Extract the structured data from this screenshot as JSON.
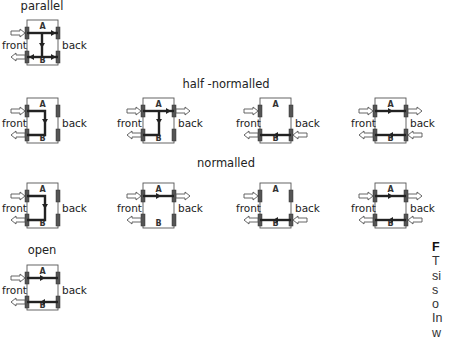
{
  "headings": {
    "parallel": "parallel",
    "half_normalled": "half -normalled",
    "normalled": "normalled",
    "open": "open"
  },
  "labels": {
    "front": "front",
    "back": "back",
    "jack_a": "A",
    "jack_b": "B"
  },
  "diagrams": [
    {
      "id": "parallel",
      "row": "parallel",
      "front_in": true,
      "front_out": true,
      "back_in": false,
      "back_out": false,
      "path": "A->B split, A->back, B->back"
    },
    {
      "id": "half-normalled-1",
      "row": "half-normalled",
      "front_in": true,
      "front_out": true,
      "back_in": false,
      "back_out": false,
      "path": "A front to B front (loop)"
    },
    {
      "id": "half-normalled-2",
      "row": "half-normalled",
      "front_in": true,
      "front_out": true,
      "back_in": false,
      "back_out": true,
      "path": "A front to back and down to B"
    },
    {
      "id": "half-normalled-3",
      "row": "half-normalled",
      "front_in": true,
      "front_out": true,
      "back_in": true,
      "back_out": false,
      "path": "B back to B front"
    },
    {
      "id": "half-normalled-4",
      "row": "half-normalled",
      "front_in": true,
      "front_out": true,
      "back_in": true,
      "back_out": true,
      "path": "A through, B through"
    },
    {
      "id": "normalled-1",
      "row": "normalled",
      "front_in": true,
      "front_out": true,
      "back_in": false,
      "back_out": false,
      "path": "A front to B front (loop)"
    },
    {
      "id": "normalled-2",
      "row": "normalled",
      "front_in": true,
      "front_out": true,
      "back_in": false,
      "back_out": true,
      "path": "A front to A back"
    },
    {
      "id": "normalled-3",
      "row": "normalled",
      "front_in": true,
      "front_out": true,
      "back_in": true,
      "back_out": false,
      "path": "B back to B front"
    },
    {
      "id": "normalled-4",
      "row": "normalled",
      "front_in": true,
      "front_out": true,
      "back_in": true,
      "back_out": true,
      "path": "A through, B through"
    },
    {
      "id": "open",
      "row": "open",
      "front_in": true,
      "front_out": true,
      "back_in": false,
      "back_out": false,
      "path": "A through, B through (open)"
    }
  ],
  "side_text": {
    "line1": "F",
    "line2": "T",
    "line3": "si",
    "line4": "s",
    "line5": "o",
    "line6": "In",
    "line7": "w"
  },
  "colors": {
    "signal": "#222222",
    "box": "#555555",
    "arrow_fill": "#ffffff",
    "jack": "#444444"
  }
}
